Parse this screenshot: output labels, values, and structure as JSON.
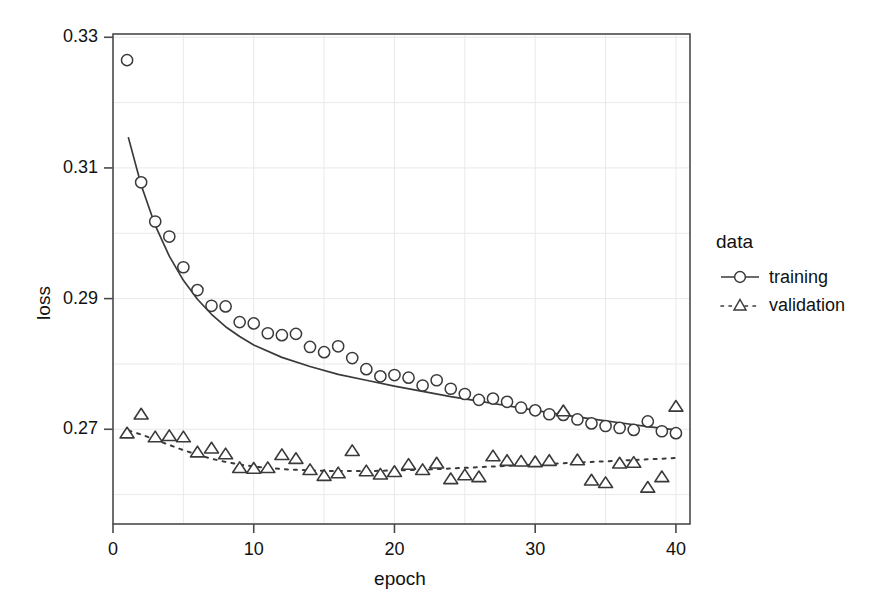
{
  "chart_data": {
    "type": "scatter",
    "title": "",
    "subtitle": "",
    "xlabel": "epoch",
    "ylabel": "loss",
    "xlim": [
      0,
      41
    ],
    "ylim": [
      0.2555,
      0.3305
    ],
    "grid": true,
    "x_ticks": [
      0,
      10,
      20,
      30,
      40
    ],
    "x_tick_labels": [
      "0",
      "10",
      "20",
      "30",
      "40"
    ],
    "y_ticks": [
      0.27,
      0.29,
      0.31,
      0.33
    ],
    "y_tick_labels": [
      "0.27",
      "0.29",
      "0.31",
      "0.33"
    ],
    "legend": {
      "title": "data",
      "position": "right",
      "entries": [
        {
          "label": "training",
          "marker": "circle",
          "line": "solid",
          "color": "#3a3a3a"
        },
        {
          "label": "validation",
          "marker": "triangle",
          "line": "dotted",
          "color": "#3a3a3a"
        }
      ]
    },
    "series": [
      {
        "name": "training",
        "marker": "circle",
        "line": "solid",
        "x": [
          1,
          2,
          3,
          4,
          5,
          6,
          7,
          8,
          9,
          10,
          11,
          12,
          13,
          14,
          15,
          16,
          17,
          18,
          19,
          20,
          21,
          22,
          23,
          24,
          25,
          26,
          27,
          28,
          29,
          30,
          31,
          32,
          33,
          34,
          35,
          36,
          37,
          38,
          39,
          40
        ],
        "y": [
          0.3265,
          0.3078,
          0.3018,
          0.2995,
          0.2948,
          0.2913,
          0.2889,
          0.2888,
          0.2864,
          0.2862,
          0.2847,
          0.2844,
          0.2846,
          0.2826,
          0.2818,
          0.2827,
          0.2809,
          0.2792,
          0.2781,
          0.2783,
          0.2779,
          0.2767,
          0.2775,
          0.2762,
          0.2754,
          0.2745,
          0.2747,
          0.2742,
          0.2733,
          0.2729,
          0.2723,
          0.2722,
          0.2715,
          0.2709,
          0.2705,
          0.2702,
          0.2699,
          0.2712,
          0.2697,
          0.2694
        ],
        "fit_line": {
          "description": "smooth decreasing trend fit through training points",
          "x": [
            1.1,
            2,
            3,
            4,
            5,
            6,
            7,
            8,
            9,
            10,
            12,
            14,
            16,
            18,
            20,
            22,
            24,
            26,
            28,
            30,
            32,
            34,
            36,
            38,
            40
          ],
          "y": [
            0.3146,
            0.3074,
            0.3012,
            0.2965,
            0.2928,
            0.2899,
            0.2876,
            0.2857,
            0.2842,
            0.2829,
            0.281,
            0.2796,
            0.2784,
            0.2775,
            0.2766,
            0.2758,
            0.275,
            0.2743,
            0.2736,
            0.2729,
            0.2722,
            0.2716,
            0.271,
            0.2704,
            0.2699
          ]
        }
      },
      {
        "name": "validation",
        "marker": "triangle",
        "line": "dotted",
        "x": [
          1,
          2,
          3,
          4,
          5,
          6,
          7,
          8,
          9,
          10,
          11,
          12,
          13,
          14,
          15,
          16,
          17,
          18,
          19,
          20,
          21,
          22,
          23,
          24,
          25,
          26,
          27,
          28,
          29,
          30,
          31,
          32,
          33,
          34,
          35,
          36,
          37,
          38,
          39,
          40
        ],
        "y": [
          0.2694,
          0.2723,
          0.2688,
          0.269,
          0.2688,
          0.2665,
          0.2671,
          0.2662,
          0.2641,
          0.264,
          0.2641,
          0.2661,
          0.2655,
          0.2638,
          0.2629,
          0.2633,
          0.2667,
          0.2636,
          0.2631,
          0.2635,
          0.2646,
          0.2638,
          0.2648,
          0.2624,
          0.263,
          0.2627,
          0.2659,
          0.2652,
          0.2651,
          0.265,
          0.2652,
          0.2728,
          0.2653,
          0.2622,
          0.2618,
          0.2648,
          0.2649,
          0.2611,
          0.2627,
          0.2735
        ],
        "fit_line": {
          "description": "smooth nearly-flat trend fit through validation points",
          "x": [
            1.1,
            2,
            3,
            4,
            5,
            6,
            7,
            8,
            9,
            10,
            12,
            14,
            16,
            18,
            20,
            22,
            24,
            26,
            28,
            30,
            32,
            34,
            36,
            38,
            40
          ],
          "y": [
            0.2698,
            0.2692,
            0.2684,
            0.2676,
            0.2668,
            0.2661,
            0.2655,
            0.265,
            0.2646,
            0.2643,
            0.2639,
            0.2637,
            0.2636,
            0.2636,
            0.2637,
            0.2638,
            0.264,
            0.2642,
            0.2644,
            0.2646,
            0.2648,
            0.265,
            0.2652,
            0.2654,
            0.2656
          ]
        }
      }
    ]
  }
}
